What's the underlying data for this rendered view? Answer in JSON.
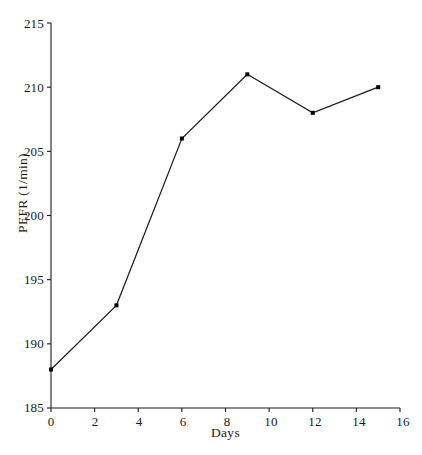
{
  "chart_data": {
    "type": "line",
    "title": "",
    "xlabel": "Days",
    "ylabel": "PEFR (1/min)",
    "x": [
      0,
      3,
      6,
      9,
      12,
      15
    ],
    "values": [
      188,
      193,
      206,
      211,
      208,
      210
    ],
    "series": [
      {
        "name": "PEFR",
        "x": [
          0,
          3,
          6,
          9,
          12,
          15
        ],
        "values": [
          188,
          193,
          206,
          211,
          208,
          210
        ]
      }
    ],
    "xlim": [
      0,
      16
    ],
    "ylim": [
      185,
      215
    ],
    "xticks": [
      "0",
      "2",
      "4",
      "6",
      "8",
      "10",
      "12",
      "14",
      "16"
    ],
    "xtick_values": [
      0,
      2,
      4,
      6,
      8,
      10,
      12,
      14,
      16
    ],
    "yticks": [
      "185",
      "190",
      "195",
      "200",
      "205",
      "210",
      "215"
    ],
    "ytick_values": [
      185,
      190,
      195,
      200,
      205,
      210,
      215
    ],
    "grid": false,
    "legend": "none",
    "marker": "square",
    "line_color": "#1a1a1a",
    "marker_color": "#000000",
    "axis_color": "#1a1a1a",
    "background": "#ffffff"
  }
}
